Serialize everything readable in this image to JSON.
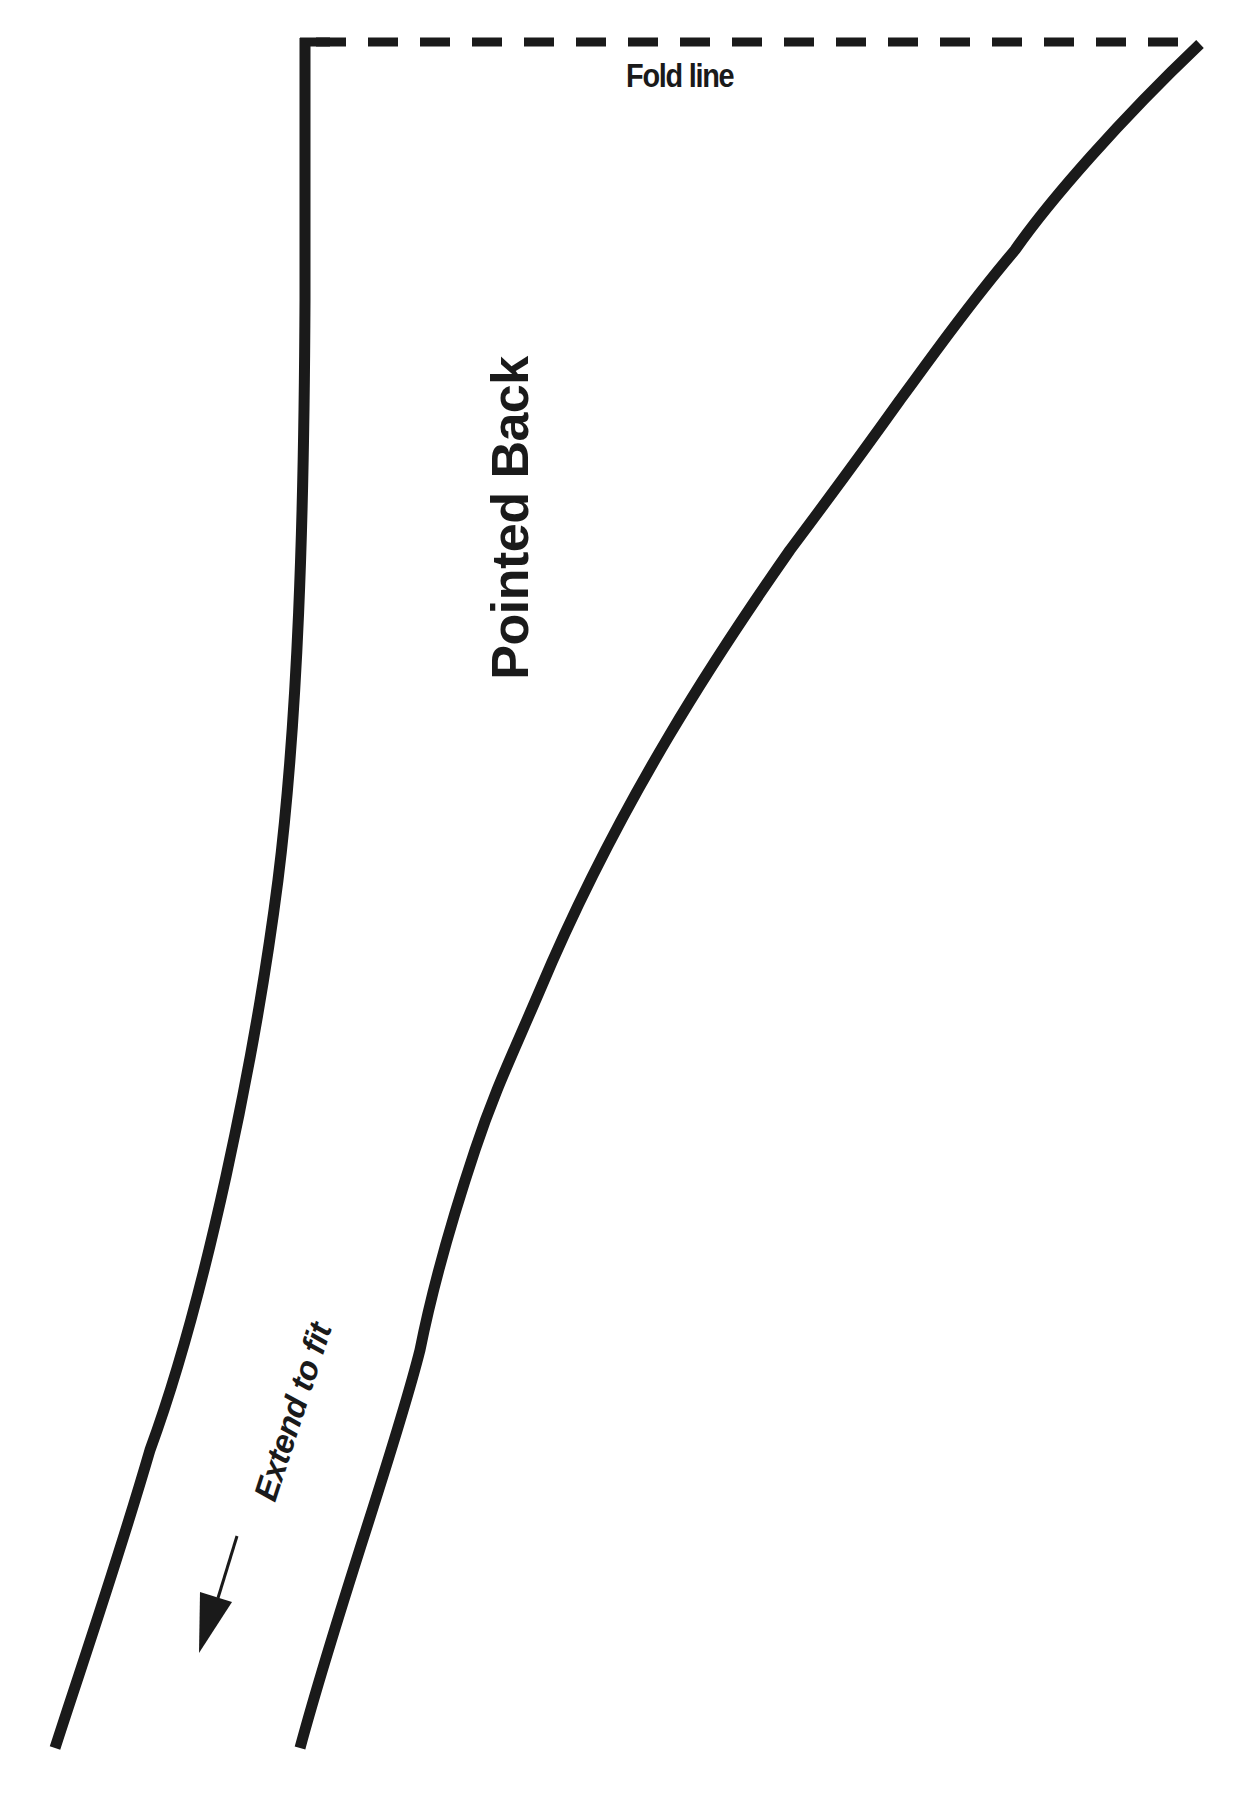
{
  "pattern": {
    "title": "Pointed Back",
    "fold_label": "Fold line",
    "extend_label": "Extend to fit",
    "stroke_color": "#1a1a1a",
    "background_color": "#ffffff",
    "icons": {
      "arrow": "down-left-arrow-icon"
    }
  }
}
